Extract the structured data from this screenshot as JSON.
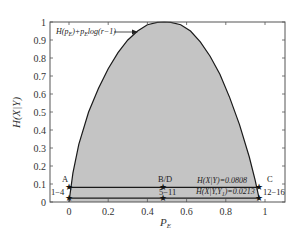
{
  "chart_data": {
    "type": "area",
    "title": "",
    "xlabel": "P_E",
    "ylabel": "H(X|Y)",
    "xlim": [
      -0.09,
      1.1
    ],
    "ylim": [
      0,
      1
    ],
    "grid": false,
    "x_ticks": [
      "0",
      "0.2",
      "0.4",
      "0.6",
      "0.8",
      "1"
    ],
    "x_tick_values": [
      0,
      0.2,
      0.4,
      0.6,
      0.8,
      1
    ],
    "y_ticks": [
      "0",
      "0.1",
      "0.2",
      "0.3",
      "0.4",
      "0.5",
      "0.6",
      "0.7",
      "0.8",
      "0.9",
      "1"
    ],
    "y_tick_values": [
      0,
      0.1,
      0.2,
      0.3,
      0.4,
      0.5,
      0.6,
      0.7,
      0.8,
      0.9,
      1
    ],
    "curve": {
      "name": "H(p_E)+p_E log(r-1)",
      "x": [
        0,
        0.02,
        0.05,
        0.1,
        0.15,
        0.2,
        0.25,
        0.3,
        0.35,
        0.4,
        0.45,
        0.485,
        0.52,
        0.57,
        0.62,
        0.67,
        0.72,
        0.77,
        0.82,
        0.87,
        0.92,
        0.95,
        0.97
      ],
      "y": [
        0,
        0.16,
        0.32,
        0.5,
        0.63,
        0.74,
        0.83,
        0.9,
        0.95,
        0.985,
        0.998,
        1.0,
        0.998,
        0.985,
        0.95,
        0.89,
        0.81,
        0.71,
        0.58,
        0.43,
        0.25,
        0.12,
        0.02
      ]
    },
    "series": [
      {
        "name": "H(X|Y)=0.0808",
        "type": "hline",
        "y": 0.0808,
        "x_range": [
          0,
          0.97
        ]
      },
      {
        "name": "H(X|Y,Y_1)=0.0213",
        "type": "hline",
        "y": 0.0213,
        "x_range": [
          0,
          0.97
        ]
      }
    ],
    "points": [
      {
        "label": "A",
        "x": 0,
        "y": 0.0808
      },
      {
        "label": "B/D",
        "x": 0.48,
        "y": 0.0808
      },
      {
        "label": "C",
        "x": 0.97,
        "y": 0.0808
      },
      {
        "label": "1-4",
        "x": 0,
        "y": 0.0213
      },
      {
        "label": "5-11",
        "x": 0.48,
        "y": 0.0213
      },
      {
        "label": "12-16",
        "x": 0.97,
        "y": 0.0213
      }
    ],
    "annotations": [
      {
        "text": "H(p_E)+p_E log(r-1)",
        "arrow_to": [
          0.44,
          0.94
        ]
      },
      {
        "text": "H(X|Y)=0.0808"
      },
      {
        "text": "H(X|Y,Y_1)=0.0213"
      }
    ],
    "colors": {
      "fill": "#c4c4c4",
      "line": "#1a1a1a",
      "axis": "#555555"
    }
  },
  "labels": {
    "curve_label": "H(p",
    "curve_label_sub1": "E",
    "curve_label_mid": ")+p",
    "curve_label_sub2": "E",
    "curve_label_end": "log(r−1)",
    "hxy": "H(X|Y)=0.0808",
    "hxyy": "H(X|Y,Y",
    "hxyy_sub": "1",
    "hxyy_end": ")=0.0213",
    "A": "A",
    "BD": "B/D",
    "C": "C",
    "p14": "1−4",
    "p511": "5−11",
    "p1216": "12−16",
    "xlabel_main": "P",
    "xlabel_sub": "E",
    "ylabel": "H(X|Y)"
  }
}
